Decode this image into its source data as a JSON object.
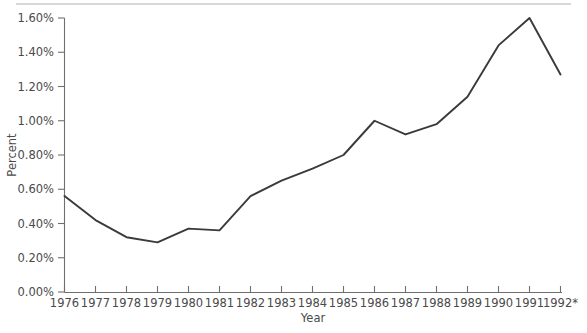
{
  "chart_data": {
    "type": "line",
    "title": "",
    "subtitle": "",
    "xlabel": "Year",
    "ylabel": "Percent",
    "grid": false,
    "legend": false,
    "legend_position": "none",
    "x": [
      "1976",
      "1977",
      "1978",
      "1979",
      "1980",
      "1981",
      "1982",
      "1983",
      "1984",
      "1985",
      "1986",
      "1987",
      "1988",
      "1989",
      "1990",
      "1991",
      "1992*"
    ],
    "categories": [
      "1976",
      "1977",
      "1978",
      "1979",
      "1980",
      "1981",
      "1982",
      "1983",
      "1984",
      "1985",
      "1986",
      "1987",
      "1988",
      "1989",
      "1990",
      "1991",
      "1992*"
    ],
    "values": [
      0.56,
      0.42,
      0.32,
      0.29,
      0.37,
      0.36,
      0.56,
      0.65,
      0.72,
      0.8,
      1.0,
      0.92,
      0.98,
      1.14,
      1.44,
      1.6,
      1.27
    ],
    "series": [
      {
        "name": "Percent",
        "color": "#3a3a3a",
        "values": [
          0.56,
          0.42,
          0.32,
          0.29,
          0.37,
          0.36,
          0.56,
          0.65,
          0.72,
          0.8,
          1.0,
          0.92,
          0.98,
          1.14,
          1.44,
          1.6,
          1.27
        ]
      }
    ],
    "ylim": [
      0.0,
      1.6
    ],
    "xlim": [
      "1976",
      "1992*"
    ],
    "ytick_values": [
      0.0,
      0.2,
      0.4,
      0.6,
      0.8,
      1.0,
      1.2,
      1.4,
      1.6
    ],
    "ytick_labels": [
      "0.00%",
      "0.20%",
      "0.40%",
      "0.60%",
      "0.80%",
      "1.00%",
      "1.20%",
      "1.40%",
      "1.60%"
    ],
    "xtick_labels": [
      "1976",
      "1977",
      "1978",
      "1979",
      "1980",
      "1981",
      "1982",
      "1983",
      "1984",
      "1985",
      "1986",
      "1987",
      "1988",
      "1989",
      "1990",
      "1991",
      "1992*"
    ],
    "annotations": []
  }
}
